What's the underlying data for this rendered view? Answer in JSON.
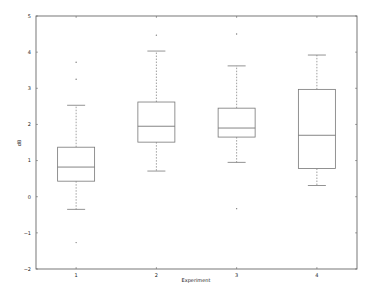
{
  "chart_data": {
    "type": "box",
    "title": "",
    "xlabel": "Experiment",
    "ylabel": "dB",
    "ylim": [
      -2,
      5
    ],
    "yticks": [
      -2,
      -1,
      0,
      1,
      2,
      3,
      4,
      5
    ],
    "categories": [
      "1",
      "2",
      "3",
      "4"
    ],
    "grid": false,
    "legend": null,
    "boxes": [
      {
        "name": "1",
        "whisker_low": -0.35,
        "q1": 0.43,
        "median": 0.82,
        "q3": 1.37,
        "whisker_high": 2.53,
        "outliers": [
          3.72,
          3.25,
          -1.27
        ]
      },
      {
        "name": "2",
        "whisker_low": 0.71,
        "q1": 1.51,
        "median": 1.95,
        "q3": 2.62,
        "whisker_high": 4.03,
        "outliers": [
          4.47
        ]
      },
      {
        "name": "3",
        "whisker_low": 0.95,
        "q1": 1.65,
        "median": 1.9,
        "q3": 2.45,
        "whisker_high": 3.62,
        "outliers": [
          4.5,
          -0.33
        ]
      },
      {
        "name": "4",
        "whisker_low": 0.31,
        "q1": 0.78,
        "median": 1.7,
        "q3": 2.97,
        "whisker_high": 3.92,
        "outliers": []
      }
    ]
  },
  "colors": {
    "axes": "#555555",
    "box": "#777777",
    "text": "#222222",
    "background": "#ffffff"
  }
}
